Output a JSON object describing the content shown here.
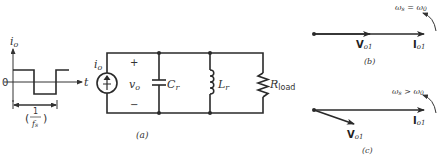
{
  "waveform": {
    "y_axis_label": "i",
    "y_axis_label_sub": "o",
    "x_axis_label": "t",
    "zero_label": "0",
    "period_label_num": "1",
    "period_label_den": "f",
    "period_label_den_sub": "s",
    "paren_open": "(",
    "paren_close": ")"
  },
  "circuit": {
    "source_label": "i",
    "source_label_sub": "o",
    "voltage_label": "v",
    "voltage_label_sub": "o",
    "plus": "+",
    "minus": "−",
    "capacitor_label": "C",
    "capacitor_label_sub": "r",
    "inductor_label": "L",
    "inductor_label_sub": "r",
    "resistor_label": "R",
    "resistor_label_sub": "load",
    "caption": "(a)"
  },
  "phasor_b": {
    "condition": "ω",
    "condition_sub1": "s",
    "condition_op": " = ω",
    "condition_sub2": "0",
    "v_label": "V",
    "v_label_sub": "o1",
    "i_label": "I",
    "i_label_sub": "o1",
    "caption": "(b)"
  },
  "phasor_c": {
    "condition": "ω",
    "condition_sub1": "s",
    "condition_op": " > ω",
    "condition_sub2": "0",
    "v_label": "V",
    "v_label_sub": "o1",
    "i_label": "I",
    "i_label_sub": "o1",
    "caption": "(c)"
  }
}
